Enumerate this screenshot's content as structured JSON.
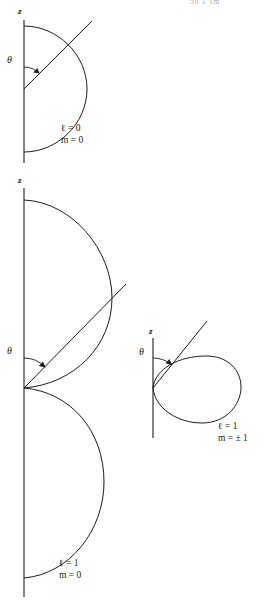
{
  "page": {
    "width": 270,
    "height": 604,
    "background": "#ffffff",
    "ink_color": "#1c1c1c",
    "running_head": "50 1 1m"
  },
  "figures": [
    {
      "id": "figure-l0-m0",
      "name": "angular-distribution-l0-m0",
      "axis_label": "z",
      "angle_label": "θ",
      "quantum_numbers": {
        "l_line": "ℓ = 0",
        "m_line": "m = 0"
      },
      "shape": "circle",
      "description": "Spherical (isotropic) angular distribution; cross-section is a circle tangent to the z axis.",
      "geometry": {
        "axis_x": 24,
        "axis_top_y": 20,
        "axis_bottom_y": 163,
        "origin_y": 89,
        "radius_x": 63,
        "radius_y": 63,
        "ray_angle_deg": 45,
        "ray_length": 95
      }
    },
    {
      "id": "figure-l1-m0",
      "name": "angular-distribution-l1-m0",
      "axis_label": "z",
      "angle_label": "θ",
      "quantum_numbers": {
        "l_line": "ℓ = 1",
        "m_line": "m = 0"
      },
      "shape": "cos-squared-double-lobe",
      "description": "cos^2(theta) angular distribution; two tangent lobes above and below the origin on the z axis.",
      "geometry": {
        "axis_x": 24,
        "axis_top_y": 188,
        "axis_bottom_y": 597,
        "origin_y": 388,
        "upper_lobe_top_y": 200,
        "upper_lobe_max_x": 112,
        "lower_lobe_bottom_y": 578,
        "lower_lobe_max_x": 104,
        "ray_angle_deg": 45,
        "ray_length": 178
      }
    },
    {
      "id": "figure-l1-mpm1",
      "name": "angular-distribution-l1-m-plus-minus-1",
      "axis_label": "z",
      "angle_label": "θ",
      "quantum_numbers": {
        "l_line": "ℓ = 1",
        "m_line": "m = ± 1"
      },
      "shape": "sin-squared-torus-section",
      "description": "sin^2(theta) angular distribution; a single rounded lobe (torus cross-section) centred on the equator.",
      "geometry": {
        "axis_x": 153,
        "axis_top_y": 338,
        "axis_bottom_y": 438,
        "origin_y": 388,
        "lobe_right_x": 241,
        "lobe_top_y": 356,
        "lobe_bottom_y": 423,
        "ray_angle_deg": 52,
        "ray_length": 84
      }
    }
  ]
}
